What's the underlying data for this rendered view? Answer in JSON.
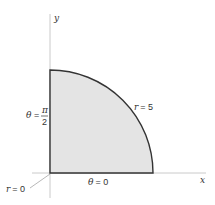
{
  "diagram": {
    "axes": {
      "x_label": "x",
      "y_label": "y"
    },
    "region": {
      "fill": "#e4e4e4",
      "stroke": "#333333",
      "radius_value": 5
    },
    "labels": {
      "r_outer_var": "r",
      "r_outer_eq": "= 5",
      "theta_top_var": "θ",
      "theta_top_eq": "=",
      "theta_top_num": "π",
      "theta_top_den": "2",
      "theta_bottom_var": "θ",
      "theta_bottom_eq": "= 0",
      "r_origin_var": "r",
      "r_origin_eq": "= 0"
    }
  }
}
